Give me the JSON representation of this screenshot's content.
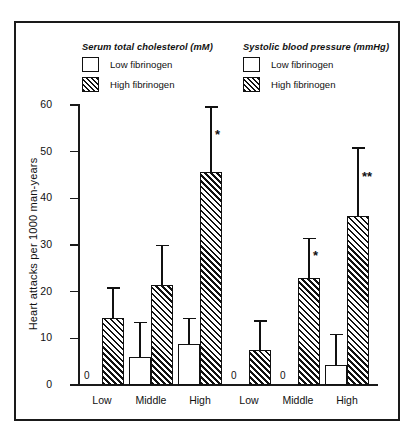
{
  "chart_data": {
    "type": "bar",
    "title": "",
    "xlabel": "",
    "ylabel": "Heart attacks per 1000 man-years",
    "ylim": [
      0,
      60
    ],
    "yticks": [
      0,
      10,
      20,
      30,
      40,
      50,
      60
    ],
    "grid": false,
    "legend_position": "top",
    "panels": [
      {
        "title": "Serum total cholesterol (mM)",
        "categories": [
          "Low",
          "Middle",
          "High"
        ]
      },
      {
        "title": "Systolic blood pressure (mmHg)",
        "categories": [
          "Low",
          "Middle",
          "High"
        ]
      }
    ],
    "series": [
      {
        "name": "Low fibrinogen",
        "swatch": "white"
      },
      {
        "name": "High fibrinogen",
        "swatch": "hatch"
      }
    ],
    "categories": [
      "Low",
      "Middle",
      "High",
      "Low",
      "Middle",
      "High"
    ],
    "bars": [
      {
        "panel": "Serum total cholesterol (mM)",
        "category": "Low",
        "series": "Low fibrinogen",
        "value": 0,
        "value_label": "0",
        "error_upper": null,
        "significance": ""
      },
      {
        "panel": "Serum total cholesterol (mM)",
        "category": "Low",
        "series": "High fibrinogen",
        "value": 14.4,
        "value_label": "",
        "error_upper": 21.0,
        "significance": ""
      },
      {
        "panel": "Serum total cholesterol (mM)",
        "category": "Middle",
        "series": "Low fibrinogen",
        "value": 5.9,
        "value_label": "",
        "error_upper": 13.6,
        "significance": ""
      },
      {
        "panel": "Serum total cholesterol (mM)",
        "category": "Middle",
        "series": "High fibrinogen",
        "value": 21.5,
        "value_label": "",
        "error_upper": 30.1,
        "significance": ""
      },
      {
        "panel": "Serum total cholesterol (mM)",
        "category": "High",
        "series": "Low fibrinogen",
        "value": 8.8,
        "value_label": "",
        "error_upper": 14.4,
        "significance": ""
      },
      {
        "panel": "Serum total cholesterol (mM)",
        "category": "High",
        "series": "High fibrinogen",
        "value": 45.6,
        "value_label": "",
        "error_upper": 59.8,
        "significance": "*"
      },
      {
        "panel": "Systolic blood pressure (mmHg)",
        "category": "Low",
        "series": "Low fibrinogen",
        "value": 0,
        "value_label": "0",
        "error_upper": null,
        "significance": ""
      },
      {
        "panel": "Systolic blood pressure (mmHg)",
        "category": "Low",
        "series": "High fibrinogen",
        "value": 7.6,
        "value_label": "",
        "error_upper": 13.9,
        "significance": ""
      },
      {
        "panel": "Systolic blood pressure (mmHg)",
        "category": "Middle",
        "series": "Low fibrinogen",
        "value": 0,
        "value_label": "0",
        "error_upper": null,
        "significance": ""
      },
      {
        "panel": "Systolic blood pressure (mmHg)",
        "category": "Middle",
        "series": "High fibrinogen",
        "value": 22.9,
        "value_label": "",
        "error_upper": 31.6,
        "significance": "*"
      },
      {
        "panel": "Systolic blood pressure (mmHg)",
        "category": "High",
        "series": "Low fibrinogen",
        "value": 4.3,
        "value_label": "",
        "error_upper": 11.0,
        "significance": ""
      },
      {
        "panel": "Systolic blood pressure (mmHg)",
        "category": "High",
        "series": "High fibrinogen",
        "value": 36.3,
        "value_label": "",
        "error_upper": 51.0,
        "significance": "**"
      }
    ]
  },
  "axis": {
    "y_title": "Heart attacks per 1000 man-years",
    "y_tick_0": "0",
    "y_tick_10": "10",
    "y_tick_20": "20",
    "y_tick_30": "30",
    "y_tick_40": "40",
    "y_tick_50": "50",
    "y_tick_60": "60",
    "x_labels": [
      "Low",
      "Middle",
      "High",
      "Low",
      "Middle",
      "High"
    ]
  },
  "legend_left": {
    "title": "Serum total cholesterol (mM)",
    "low": "Low fibrinogen",
    "high": "High fibrinogen"
  },
  "legend_right": {
    "title": "Systolic blood pressure (mmHg)",
    "low": "Low fibrinogen",
    "high": "High fibrinogen"
  },
  "zero_marks": [
    "0",
    "0",
    "0"
  ],
  "colors": {
    "ink": "#111111",
    "background": "#ffffff"
  }
}
